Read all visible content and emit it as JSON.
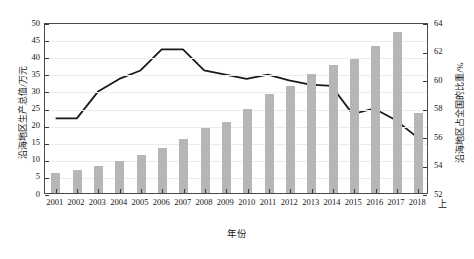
{
  "chart_data": {
    "type": "bar",
    "title": "",
    "xlabel": "年份",
    "ylabel": "沿海地区生产总值/万元",
    "y2label": "沿海地区占全国的比重/%",
    "x_unit_suffix": "上",
    "categories": [
      "2001",
      "2002",
      "2003",
      "2004",
      "2005",
      "2006",
      "2007",
      "2008",
      "2009",
      "2010",
      "2011",
      "2012",
      "2013",
      "2014",
      "2015",
      "2016",
      "2017",
      "2018"
    ],
    "ylim": [
      0,
      50
    ],
    "yticks": [
      0,
      5,
      10,
      15,
      20,
      25,
      30,
      35,
      40,
      45,
      50
    ],
    "y2lim": [
      52,
      64
    ],
    "y2ticks": [
      52,
      54,
      56,
      58,
      60,
      62,
      64
    ],
    "grid": true,
    "legend": "none",
    "series": [
      {
        "name": "沿海地区生产总值/万元",
        "type": "bar",
        "axis": "left",
        "color": "#b6b6b6",
        "values": [
          5.9,
          6.6,
          7.8,
          9.4,
          11.2,
          13.3,
          15.9,
          18.9,
          20.7,
          24.5,
          28.9,
          31.4,
          34.8,
          37.5,
          39.3,
          42.9,
          47.1,
          23.5
        ]
      },
      {
        "name": "沿海地区占全国的比重/%",
        "type": "line",
        "axis": "right",
        "color": "#1a1a1a",
        "values": [
          57.3,
          57.3,
          59.2,
          60.1,
          60.7,
          62.2,
          62.2,
          60.7,
          60.4,
          60.1,
          60.4,
          60.0,
          59.7,
          59.6,
          57.6,
          58.0,
          57.2,
          56.0
        ]
      }
    ],
    "caption": ""
  }
}
